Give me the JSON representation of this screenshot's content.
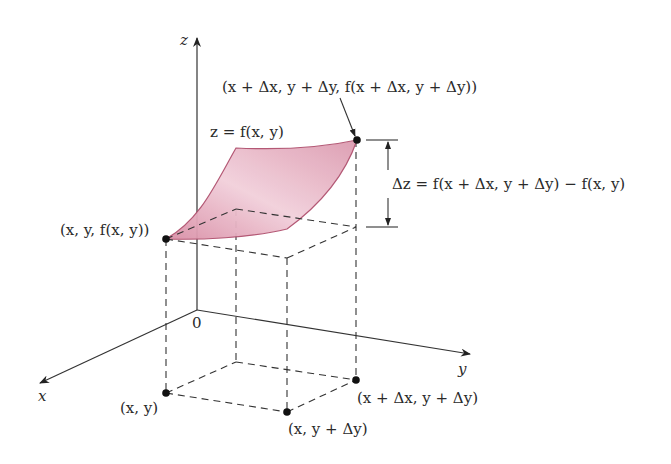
{
  "diagram": {
    "axes": {
      "z_label": "z",
      "y_label": "y",
      "x_label": "x",
      "origin_label": "0"
    },
    "surface_label": "z = f(x, y)",
    "points": {
      "top_far": "(x + Δx, y + Δy, f(x + Δx, y + Δy))",
      "top_near": "(x, y, f(x, y))",
      "base_xy": "(x, y)",
      "base_x_ydy": "(x, y + Δy)",
      "base_xdx_ydy": "(x + Δx, y + Δy)"
    },
    "delta_label": "Δz = f(x + Δx, y + Δy) − f(x, y)",
    "colors": {
      "surface_fill": "#e3a9bb",
      "surface_edge": "#b0506e",
      "line": "#333333"
    }
  }
}
